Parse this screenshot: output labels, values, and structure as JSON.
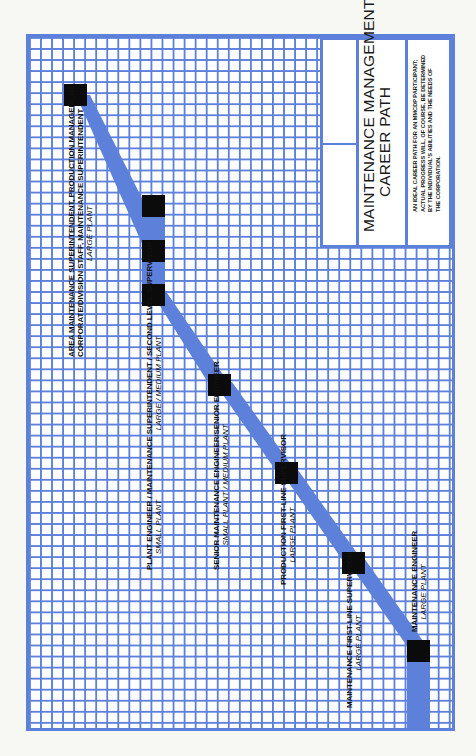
{
  "title": {
    "line1": "MAINTENANCE MANAGEMENT",
    "line2": "CAREER PATH"
  },
  "description": {
    "lines": [
      "AN IDEAL CAREER PATH FOR AN MMCDP PARTICIPANT;",
      "ACTUAL PROGRESS WILL, OF COURSE, BE DETERMINED",
      "BY THE INDIVIDUAL'S ABILITIES AND THE NEEDS OF",
      "THE CORPORATION."
    ]
  },
  "colors": {
    "grid": "#5d80da",
    "path_band": "#5d80da",
    "milestone": "#0b0b0b",
    "background": "#ffffff"
  },
  "positions": [
    {
      "id": "area-maintenance-superintendent",
      "lines": [
        "AREA MAINTENANCE SUPERINTENDENT, PRODUCTION MANAGEMENT",
        "CORPORATE/DIVISION STAFF, MAINTENANCE SUPERINTENDENT"
      ],
      "plant": "LARGE PLANT"
    },
    {
      "id": "plant-engineer",
      "lines": [
        "PLANT ENGINEER / MAINTENANCE SUPERINTENDENT / SECOND LEVEL SUPERVISOR"
      ],
      "plant_left": "SMALL PLANT",
      "plant_right": "LARGE / MEDIUM PLANT"
    },
    {
      "id": "senior-maintenance-engineer",
      "lines": [
        "SENIOR MAINTENANCE ENGINEER/SENIOR ENGINEER"
      ],
      "plant": "SMALL PLANT / MEDIUM PLANT"
    },
    {
      "id": "production-first-line-supervisor",
      "lines": [
        "PRODUCTION FIRST-LINE SUPERVISOR"
      ],
      "plant": "LARGE PLANT"
    },
    {
      "id": "maintenance-first-line-supervisor",
      "lines": [
        "MAINTENANCE FIRST-LINE SUPERVISOR"
      ],
      "plant": "LARGE PLANT"
    },
    {
      "id": "maintenance-engineer",
      "lines": [
        "MAINTENANCE ENGINEER"
      ],
      "plant": "LARGE PLANT"
    }
  ]
}
